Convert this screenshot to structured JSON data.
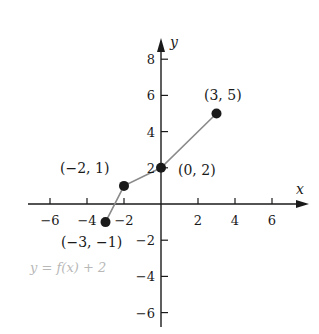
{
  "chart_data": {
    "type": "line",
    "title": "",
    "caption": "y = f(x) + 2",
    "xlabel": "x",
    "ylabel": "y",
    "xlim": [
      -7,
      8
    ],
    "ylim": [
      -7,
      9
    ],
    "grid": false,
    "x_ticks": [
      -6,
      -4,
      -2,
      2,
      4,
      6
    ],
    "y_ticks": [
      8,
      6,
      4,
      2,
      -2,
      -4,
      -6
    ],
    "x_tick_labels": [
      "−6",
      "−4",
      "−2",
      "2",
      "4",
      "6"
    ],
    "y_tick_labels": [
      "8",
      "6",
      "4",
      "2",
      "−2",
      "−4",
      "−6"
    ],
    "series": [
      {
        "name": "y = f(x) + 2",
        "points": [
          {
            "x": -3,
            "y": -1,
            "label": "(−3, −1)"
          },
          {
            "x": -2,
            "y": 1,
            "label": "(−2, 1)"
          },
          {
            "x": 0,
            "y": 2,
            "label": "(0, 2)"
          },
          {
            "x": 3,
            "y": 5,
            "label": "(3, 5)"
          }
        ]
      }
    ],
    "colors": {
      "axis": "#1a1a1a",
      "line": "#8a8a8a",
      "point": "#1a1a1a",
      "caption": "#b8b8b8"
    }
  }
}
